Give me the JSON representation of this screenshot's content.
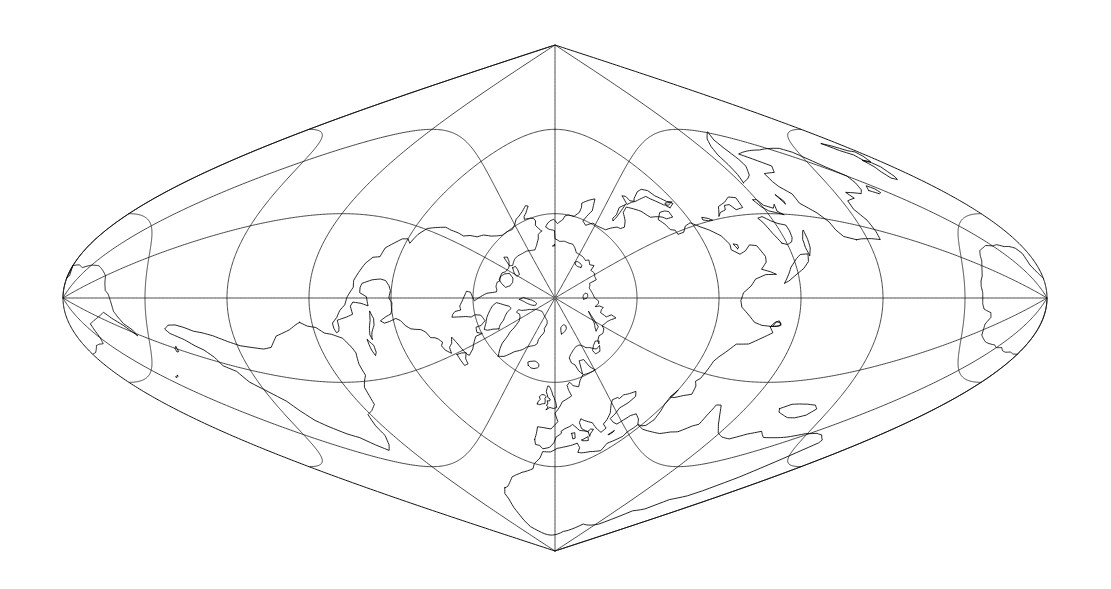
{
  "figure": {
    "title": "World map — transverse sinusoidal (Sanson-Flamsteed) projection, polar aspect",
    "kind": "map",
    "background_color": "#ffffff",
    "line_color": "#000000",
    "graticule_color": "#1a1a1a",
    "width_px": 1111,
    "height_px": 589
  },
  "projection": {
    "name": "sinusoidal",
    "aspect": "transverse",
    "center_pole_label": "North Pole",
    "pole_point_px": [
      553,
      188
    ],
    "top_apex_px": [
      553,
      45
    ],
    "bottom_apex_px": [
      553,
      551
    ],
    "left_extreme_px": [
      63,
      327
    ],
    "right_extreme_px": [
      1047,
      327
    ],
    "central_meridian_deg": 0,
    "graticule_spacing_deg": 30,
    "meridian_count": 12,
    "parallel_values_deg": [
      -60,
      -30,
      0,
      30,
      60
    ],
    "meridian_values_deg": [
      -180,
      -150,
      -120,
      -90,
      -60,
      -30,
      0,
      30,
      60,
      90,
      120,
      150
    ],
    "pole_rings_deg": [
      60,
      30,
      0
    ],
    "graticule_visible": true,
    "outline_visible": true
  },
  "labels": {
    "none_rendered": "This figure contains no text labels, axis ticks, legend, or annotations."
  },
  "features": {
    "landmasses": [
      "Greenland",
      "North America",
      "South America",
      "Africa",
      "Europe",
      "Asia",
      "Australia",
      "New Zealand",
      "Antarctica",
      "Iceland",
      "British Isles",
      "Japan",
      "Madagascar",
      "Indonesia",
      "Svalbard",
      "Novaya Zemlya",
      "Sri Lanka",
      "Cuba",
      "New Guinea"
    ]
  },
  "chart_data": {
    "type": "map",
    "title": "",
    "xlabel": "",
    "ylabel": "",
    "projection_type": "transverse sinusoidal",
    "graticule": {
      "meridian_interval_deg": 30,
      "parallel_interval_deg": 30,
      "meridians_deg": [
        -180,
        -150,
        -120,
        -90,
        -60,
        -30,
        0,
        30,
        60,
        90,
        120,
        150
      ],
      "parallels_deg": [
        -60,
        -30,
        0,
        30,
        60
      ]
    }
  }
}
